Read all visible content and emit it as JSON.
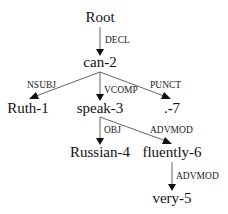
{
  "diagram": {
    "type": "dependency-tree",
    "nodes": [
      {
        "id": "root",
        "label": "Root",
        "x": 100,
        "y": 22
      },
      {
        "id": "can",
        "label": "can-2",
        "x": 100,
        "y": 67
      },
      {
        "id": "ruth",
        "label": "Ruth-1",
        "x": 28,
        "y": 113
      },
      {
        "id": "speak",
        "label": "speak-3",
        "x": 100,
        "y": 113
      },
      {
        "id": "punct",
        "label": ".-7",
        "x": 172,
        "y": 113
      },
      {
        "id": "russian",
        "label": "Russian-4",
        "x": 100,
        "y": 157
      },
      {
        "id": "fluently",
        "label": "fluently-6",
        "x": 172,
        "y": 157
      },
      {
        "id": "very",
        "label": "very-5",
        "x": 172,
        "y": 203
      }
    ],
    "edges": [
      {
        "from": "root",
        "to": "can",
        "label": "DECL"
      },
      {
        "from": "can",
        "to": "ruth",
        "label": "NSUBJ"
      },
      {
        "from": "can",
        "to": "speak",
        "label": "VCOMP"
      },
      {
        "from": "can",
        "to": "punct",
        "label": "PUNCT"
      },
      {
        "from": "speak",
        "to": "russian",
        "label": "OBJ"
      },
      {
        "from": "speak",
        "to": "fluently",
        "label": "ADVMOD"
      },
      {
        "from": "fluently",
        "to": "very",
        "label": "ADVMOD"
      }
    ]
  }
}
